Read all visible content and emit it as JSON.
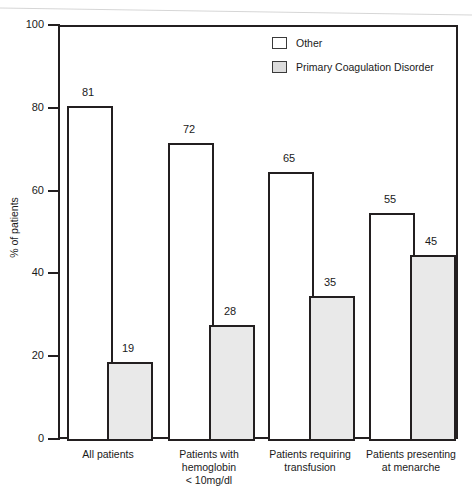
{
  "chart_data": {
    "type": "bar",
    "title": "",
    "xlabel": "",
    "ylabel": "% of patients",
    "ylim": [
      0,
      100
    ],
    "yticks": [
      0,
      20,
      40,
      60,
      80,
      100
    ],
    "ytick_labels": [
      "0",
      "20",
      "40",
      "60",
      "80",
      "100"
    ],
    "grid": false,
    "legend_position": "top-right",
    "categories": [
      "All patients",
      "Patients with hemoglobin < 10mg/dl",
      "Patients requiring transfusion",
      "Patients presenting at menarche"
    ],
    "category_lines": [
      [
        "All patients"
      ],
      [
        "Patients with",
        "hemoglobin",
        "< 10mg/dl"
      ],
      [
        "Patients requiring",
        "transfusion"
      ],
      [
        "Patients presenting",
        "at menarche"
      ]
    ],
    "series": [
      {
        "name": "Other",
        "color": "#ffffff",
        "values": [
          81,
          72,
          65,
          55
        ],
        "labels": [
          "81",
          "72",
          "65",
          "55"
        ]
      },
      {
        "name": "Primary Coagulation Disorder",
        "color": "#e9e9e9",
        "values": [
          19,
          28,
          35,
          45
        ],
        "labels": [
          "19",
          "28",
          "35",
          "45"
        ]
      }
    ]
  },
  "legend": {
    "entries": [
      {
        "label": "Other",
        "swatch": "white-swatch-icon"
      },
      {
        "label": "Primary Coagulation Disorder",
        "swatch": "gray-swatch-icon"
      }
    ]
  },
  "colors": {
    "axis": "#231f20",
    "other_fill": "#ffffff",
    "pcd_fill": "#e9e9e9",
    "text": "#1a1a1a"
  }
}
